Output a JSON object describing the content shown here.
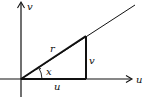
{
  "diagram": {
    "axes": {
      "horizontal_label": "u",
      "vertical_label": "v"
    },
    "triangle": {
      "hypotenuse_label": "r",
      "opposite_label": "v",
      "adjacent_label": "u",
      "angle_label": "x"
    },
    "colors": {
      "stroke": "#111111",
      "background": "#ffffff"
    }
  }
}
